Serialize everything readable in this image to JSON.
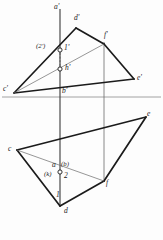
{
  "drawing": {
    "type": "descriptive-geometry-orthographic-projection",
    "title": "Two-view projection of intersecting triangles",
    "background_color": "#fdfdfd",
    "line_color": "#1b1b1b",
    "thin_line_color": "#555555",
    "ground_line": {
      "name": "ground-line",
      "y": 97,
      "x1": 2,
      "x2": 161
    },
    "vertical_axes": [
      {
        "name": "axis-a-b",
        "x": 60,
        "y1": 9,
        "y2": 205
      },
      {
        "name": "axis-f",
        "x": 104,
        "y1": 42,
        "y2": 185
      }
    ],
    "front_view": {
      "name": "front-view",
      "triangle_cde": {
        "points": [
          [
            14,
            93
          ],
          [
            134,
            79
          ],
          [
            76,
            28
          ]
        ],
        "labels": [
          "c'",
          "e'",
          "d'"
        ]
      },
      "triangle_cdf_note": "second triangle c'-f' with chord",
      "segment_c_f": {
        "from": [
          14,
          93
        ],
        "to": [
          104,
          44
        ]
      },
      "segment_f_e": {
        "from": [
          104,
          44
        ],
        "to": [
          134,
          79
        ]
      },
      "segment_d_f": {
        "from": [
          76,
          28
        ],
        "to": [
          104,
          44
        ]
      },
      "point_1": {
        "x": 60,
        "y": 50,
        "label": "1'"
      },
      "point_2": {
        "x": 60,
        "y": 50,
        "label": "(2')"
      },
      "point_h": {
        "x": 60,
        "y": 69,
        "label": "h'"
      },
      "dashed_link": {
        "x": 60,
        "y1": 52,
        "y2": 67
      }
    },
    "top_view": {
      "name": "top-view",
      "triangle_points": [
        [
          17,
          150
        ],
        [
          146,
          117
        ],
        [
          60,
          206
        ]
      ],
      "labels": [
        "c",
        "e",
        "d"
      ],
      "point_f": {
        "x": 104,
        "y": 181,
        "label": "f"
      },
      "point_ab": {
        "x": 60,
        "y": 172,
        "label_left": "a",
        "label_right": "(b)"
      },
      "point_k": {
        "label": "(k)"
      },
      "point_2": {
        "label": "2"
      },
      "point_1": {
        "label": "1"
      }
    },
    "labels": [
      {
        "name": "label-a-prime",
        "text": "a'",
        "x": 55,
        "y": 5,
        "interactable": false
      },
      {
        "name": "label-d-prime",
        "text": "d'",
        "x": 75,
        "y": 18,
        "interactable": false
      },
      {
        "name": "label-f-prime",
        "text": "f'",
        "x": 104,
        "y": 33,
        "interactable": false
      },
      {
        "name": "label-2-prime",
        "text": "(2')",
        "x": 39,
        "y": 43,
        "interactable": false
      },
      {
        "name": "label-1-prime",
        "text": "1'",
        "x": 63,
        "y": 45,
        "interactable": false
      },
      {
        "name": "label-h-prime",
        "text": "h'",
        "x": 64,
        "y": 65,
        "interactable": false
      },
      {
        "name": "label-c-prime",
        "text": "c'",
        "x": 4,
        "y": 86,
        "interactable": false
      },
      {
        "name": "label-e-prime",
        "text": "e'",
        "x": 137,
        "y": 76,
        "interactable": false
      },
      {
        "name": "label-b-prime",
        "text": "b'",
        "x": 62,
        "y": 88,
        "interactable": false
      },
      {
        "name": "label-e",
        "text": "e",
        "x": 148,
        "y": 112,
        "interactable": false
      },
      {
        "name": "label-c",
        "text": "c",
        "x": 8,
        "y": 147,
        "interactable": false
      },
      {
        "name": "label-a",
        "text": "a",
        "x": 53,
        "y": 163,
        "interactable": false
      },
      {
        "name": "label-b",
        "text": "(b)",
        "x": 62,
        "y": 163,
        "interactable": false
      },
      {
        "name": "label-k",
        "text": "(k)",
        "x": 46,
        "y": 172,
        "interactable": false
      },
      {
        "name": "label-2",
        "text": "2",
        "x": 63,
        "y": 173,
        "interactable": false
      },
      {
        "name": "label-f",
        "text": "f",
        "x": 105,
        "y": 180,
        "interactable": false
      },
      {
        "name": "label-1",
        "text": "1",
        "x": 57,
        "y": 192,
        "interactable": false
      },
      {
        "name": "label-d",
        "text": "d",
        "x": 64,
        "y": 208,
        "interactable": false
      }
    ]
  }
}
